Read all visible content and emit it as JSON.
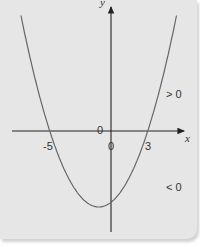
{
  "diagram": {
    "type": "parabola-graph",
    "function": "y = (x + 5)(x - 3)",
    "axes": {
      "x_label": "x",
      "y_label": "y",
      "origin_label": "0"
    },
    "roots": [
      {
        "value": -5,
        "label": "-5"
      },
      {
        "value": 3,
        "label": "3"
      }
    ],
    "zero_labels": [
      "0",
      "0"
    ],
    "region_labels": {
      "above": "> 0",
      "below": "< 0"
    },
    "colors": {
      "background": "#e6e6e6",
      "curve": "#666666",
      "axes": "#222222"
    }
  }
}
